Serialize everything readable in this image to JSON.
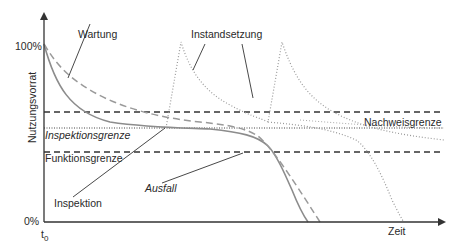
{
  "diagram": {
    "axes": {
      "y_label": "Nutzungsvorrat",
      "y_top_tick": "100%",
      "y_bottom_tick": "0%",
      "x_label": "Zeit",
      "x_origin_tick_base": "t",
      "x_origin_tick_sub": "0"
    },
    "thresholds": {
      "nachweisgrenze": "Nachweisgrenze",
      "inspektionsgrenze": "Inspektionsgrenze",
      "funktionsgrenze": "Funktionsgrenze"
    },
    "annotations": {
      "wartung": "Wartung",
      "instandsetzung": "Instandsetzung",
      "inspektion": "Inspektion",
      "ausfall": "Ausfall"
    },
    "colors": {
      "axis": "#333333",
      "curve_solid": "#8c8c8c",
      "curve_dashed": "#9a9a9a",
      "curve_dotted": "#9a9a9a",
      "threshold": "#333333",
      "text": "#2a2a2a"
    }
  }
}
